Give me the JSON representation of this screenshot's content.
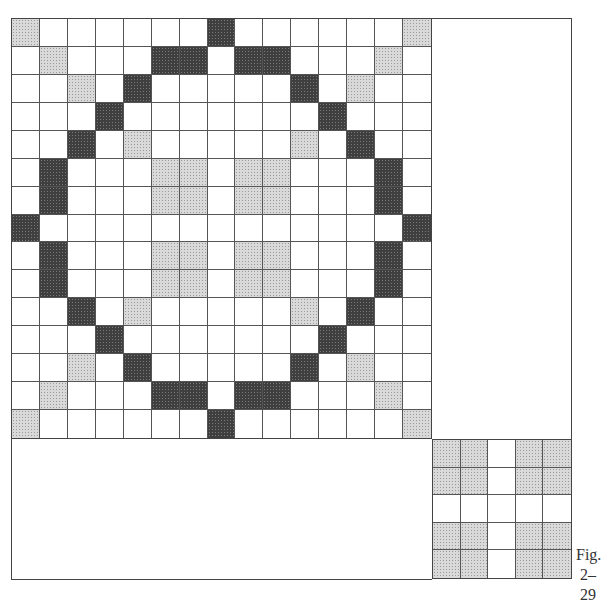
{
  "figure": {
    "caption_line1": "Fig.",
    "caption_line2": "2–29"
  },
  "colors": {
    "dark_fill": "#3f3f3f",
    "light_fill": "#d9d9d9",
    "empty_fill": "#ffffff",
    "line": "#444444"
  },
  "main_grid": {
    "rows": 15,
    "cols": 15,
    "legend": {
      "D": "dark shaded",
      "L": "light shaded",
      ".": "empty"
    },
    "pattern": [
      "L......D......L",
      ".L...DD.DD...L.",
      "..L.D.....D.L..",
      "...D.......D...",
      "..D.L.....L.D..",
      ".D...LL.LL...D.",
      ".D...LL.LL...D.",
      "D.............D",
      ".D...LL.LL...D.",
      ".D...LL.LL...D.",
      "..D.L.....L.D..",
      "...D.......D...",
      "..L.D.....D.L..",
      ".L...DD.DD...L.",
      "L......D......L"
    ]
  },
  "small_grid": {
    "rows": 5,
    "cols": 5,
    "pattern": [
      "LL.LL",
      "LL.LL",
      ".....",
      "LL.LL",
      "LL.LL"
    ]
  }
}
